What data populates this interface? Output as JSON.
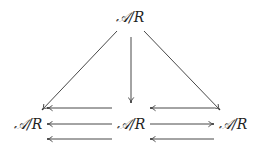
{
  "diagram": {
    "type": "commutative-diagram",
    "nodes": {
      "top": {
        "label": "A/R",
        "calligraphic": "𝒜",
        "rest": "/R"
      },
      "left": {
        "label": "A/R",
        "calligraphic": "𝒜",
        "rest": "/R"
      },
      "center": {
        "label": "A/R",
        "calligraphic": "𝒜",
        "rest": "/R"
      },
      "right": {
        "label": "A/R",
        "calligraphic": "𝒜",
        "rest": "/R"
      }
    },
    "edges": [
      {
        "from": "top",
        "to": "left",
        "style": "diagonal"
      },
      {
        "from": "top",
        "to": "center",
        "style": "vertical"
      },
      {
        "from": "top",
        "to": "right",
        "style": "diagonal"
      },
      {
        "from": "center",
        "to": "left",
        "row": "upper"
      },
      {
        "from": "center",
        "to": "left",
        "row": "middle"
      },
      {
        "from": "center",
        "to": "left",
        "row": "lower"
      },
      {
        "from": "right",
        "to": "center",
        "row": "upper"
      },
      {
        "from": "center",
        "to": "right",
        "row": "middle"
      },
      {
        "from": "right",
        "to": "center",
        "row": "lower"
      }
    ],
    "colors": {
      "stroke": "#333333",
      "text": "#222222",
      "background": "#ffffff"
    }
  }
}
